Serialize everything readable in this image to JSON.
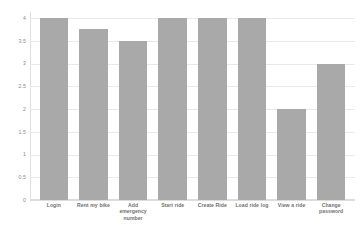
{
  "chart_data": {
    "type": "bar",
    "title": "",
    "xlabel": "",
    "ylabel": "",
    "categories": [
      "Login",
      "Rent my bike",
      "Add emergency number",
      "Start ride",
      "Create Ride",
      "Load ride log",
      "View a ride",
      "Change password"
    ],
    "values": [
      4,
      3.75,
      3.5,
      4,
      4,
      4,
      2,
      3
    ],
    "ylim": [
      0,
      4
    ],
    "yticks": [
      "0",
      "0.5",
      "1",
      "1.5",
      "2",
      "2.5",
      "3",
      "3.5",
      "4"
    ],
    "ytick_values": [
      0,
      0.5,
      1,
      1.5,
      2,
      2.5,
      3,
      3.5,
      4
    ],
    "grid": true,
    "legend": null,
    "bar_color": "#a9a9a9",
    "grid_color": "#e9e9e9",
    "background_color": "#ffffff",
    "tick_label_color": "#8a8a8a",
    "category_label_color": "#6f6f6f"
  }
}
